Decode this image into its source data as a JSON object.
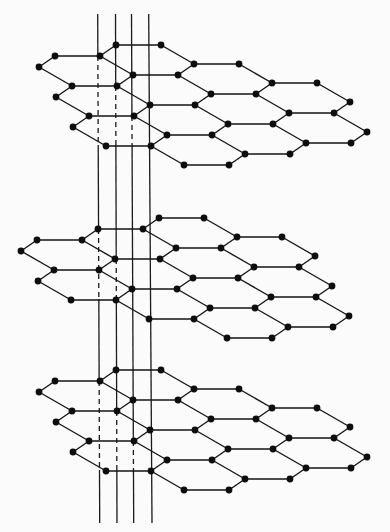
{
  "diagram": {
    "title": "Layered hexagonal lattice (graphite-like stacked sheets) with vertical reference lines",
    "canvas": {
      "width": 390,
      "height": 532,
      "background": "#fbfbfb"
    },
    "style": {
      "line_color": "#151515",
      "atom_color": "#0d0d0d",
      "atom_radius": 3.4
    },
    "hex_shape": {
      "note": "vertices relative to top-left vertex: TL, TL+e1, TL+e1+e2, TL+e1+e2+e3, TL+e2+e3, TL+e3",
      "e1": [
        45,
        0
      ],
      "e2": [
        33,
        19
      ],
      "e3": [
        -16,
        11
      ]
    },
    "layers": [
      {
        "name": "top-sheet",
        "origin": [
          55,
          56
        ],
        "hexagons": [
          [
            0,
            0
          ],
          [
            0,
            1
          ],
          [
            0,
            2
          ],
          [
            1,
            -1
          ],
          [
            1,
            0
          ],
          [
            1,
            1
          ],
          [
            1,
            2
          ],
          [
            2,
            -1
          ],
          [
            2,
            0
          ],
          [
            2,
            1
          ],
          [
            3,
            -1
          ],
          [
            3,
            0
          ]
        ]
      },
      {
        "name": "middle-sheet",
        "origin": [
          37,
          240
        ],
        "hexagons": [
          [
            0,
            0
          ],
          [
            0,
            1
          ],
          [
            1,
            -1
          ],
          [
            1,
            0
          ],
          [
            1,
            1
          ],
          [
            2,
            -2
          ],
          [
            2,
            -1
          ],
          [
            2,
            0
          ],
          [
            2,
            1
          ],
          [
            3,
            -2
          ],
          [
            3,
            -1
          ],
          [
            3,
            0
          ]
        ]
      },
      {
        "name": "bottom-sheet",
        "origin": [
          55,
          381
        ],
        "hexagons": [
          [
            0,
            0
          ],
          [
            0,
            1
          ],
          [
            0,
            2
          ],
          [
            1,
            -1
          ],
          [
            1,
            0
          ],
          [
            1,
            1
          ],
          [
            1,
            2
          ],
          [
            2,
            -1
          ],
          [
            2,
            0
          ],
          [
            2,
            1
          ],
          [
            3,
            -1
          ],
          [
            3,
            0
          ]
        ]
      }
    ],
    "vertical_lines": [
      {
        "name": "line-1",
        "x_top": 97.7,
        "x_bottom": 99.7,
        "y_top": 14,
        "y_bottom": 523,
        "dashed": [
          [
            56,
            145
          ],
          [
            229,
            299
          ],
          [
            381,
            470
          ]
        ]
      },
      {
        "name": "line-2",
        "x_top": 115.5,
        "x_bottom": 117,
        "y_top": 14,
        "y_bottom": 523,
        "dashed": [
          [
            86,
            145
          ],
          [
            259,
            300
          ],
          [
            411,
            470
          ]
        ]
      },
      {
        "name": "line-3",
        "x_top": 131.5,
        "x_bottom": 133.7,
        "y_top": 14,
        "y_bottom": 523,
        "dashed": [
          [
            116,
            145
          ],
          [
            441,
            470
          ]
        ]
      },
      {
        "name": "line-4",
        "x_top": 148.7,
        "x_bottom": 152,
        "y_top": 14,
        "y_bottom": 523,
        "dashed": []
      }
    ]
  }
}
